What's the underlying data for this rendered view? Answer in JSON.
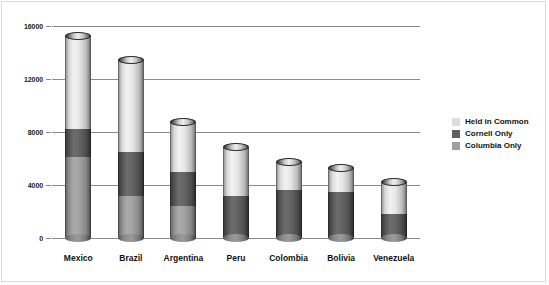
{
  "chart_data": {
    "type": "bar",
    "title": "",
    "subtitle": "",
    "xlabel": "",
    "ylabel": "",
    "stacked": true,
    "orientation": "vertical",
    "grid": true,
    "legend_position": "right",
    "ylim": [
      0,
      16000
    ],
    "yticks": [
      0,
      4000,
      8000,
      12000,
      16000
    ],
    "ytick_labels": [
      "0",
      "4000",
      "8000",
      "12000",
      "16000"
    ],
    "categories": [
      "Mexico",
      "Brazil",
      "Argentina",
      "Peru",
      "Colombia",
      "Bolivia",
      "Venezuela"
    ],
    "series": [
      {
        "name": "Held in Common",
        "color": "#e0e0e0",
        "values": [
          7000,
          6900,
          3750,
          3700,
          2050,
          1850,
          2400
        ]
      },
      {
        "name": "Cornell Only",
        "color": "#636363",
        "values": [
          2150,
          3300,
          2550,
          3150,
          3650,
          3450,
          1850
        ]
      },
      {
        "name": "Columbia Only",
        "color": "#a3a3a3",
        "values": [
          6100,
          3200,
          2450,
          0,
          0,
          0,
          0
        ]
      }
    ],
    "totals": [
      15250,
      13400,
      8750,
      6850,
      5700,
      5300,
      4250
    ]
  },
  "legend": {
    "items": [
      {
        "label": "Held in Common",
        "swatch": "#dcdcdc"
      },
      {
        "label": "Cornell Only",
        "swatch": "#5f5f5f"
      },
      {
        "label": "Columbia Only",
        "swatch": "#a0a0a0"
      }
    ]
  }
}
